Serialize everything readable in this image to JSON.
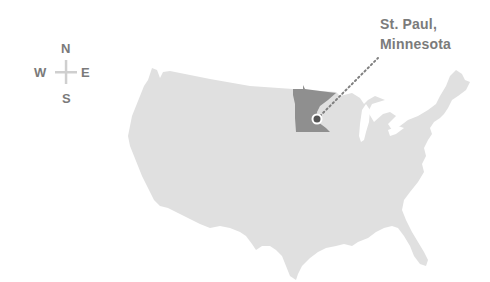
{
  "compass": {
    "north": "N",
    "south": "S",
    "east": "E",
    "west": "W"
  },
  "location_label": {
    "line1": "St. Paul,",
    "line2": "Minnesota"
  },
  "map": {
    "region": "Contiguous United States",
    "highlighted_state": "Minnesota",
    "marker_city": "St. Paul"
  },
  "colors": {
    "background": "#ffffff",
    "land": "#e0e0e0",
    "highlight_state": "#8f8f8f",
    "marker": "#555555",
    "marker_ring": "#ffffff",
    "leader_line": "#7f7f7f",
    "text": "#7b7b7b",
    "compass_cross": "#cfcfcf"
  }
}
